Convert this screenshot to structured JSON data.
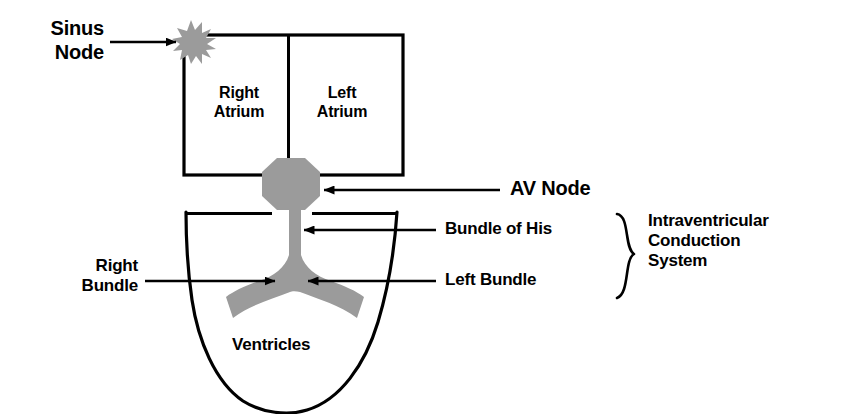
{
  "diagram": {
    "colors": {
      "tissue_gray": "#9b9b9b",
      "outline_black": "#000000",
      "background": "#ffffff"
    },
    "chambers": [
      {
        "id": "right-atrium",
        "label": "Right\nAtrium"
      },
      {
        "id": "left-atrium",
        "label": "Left\nAtrium"
      },
      {
        "id": "ventricles",
        "label": "Ventricles"
      }
    ],
    "labels": {
      "sinus_node": "Sinus\nNode",
      "av_node": "AV Node",
      "bundle_of_his": "Bundle of His",
      "left_bundle": "Left Bundle",
      "right_bundle": "Right\nBundle",
      "right_atrium": "Right\nAtrium",
      "left_atrium": "Left\nAtrium",
      "ventricles": "Ventricles",
      "group_bracket": "Intraventricular\nConduction\nSystem"
    },
    "structures": [
      {
        "name": "sinus-node",
        "shape": "starburst",
        "fill": "#9b9b9b"
      },
      {
        "name": "av-node",
        "shape": "octagon",
        "fill": "#9b9b9b"
      },
      {
        "name": "bundle-of-his",
        "shape": "stem",
        "fill": "#9b9b9b"
      },
      {
        "name": "left-bundle-branch",
        "shape": "curve",
        "fill": "#9b9b9b"
      },
      {
        "name": "right-bundle-branch",
        "shape": "curve",
        "fill": "#9b9b9b"
      }
    ],
    "annotations": [
      {
        "name": "sinus-node-pointer",
        "direction": "right",
        "target": "sinus-node"
      },
      {
        "name": "av-node-pointer",
        "direction": "left",
        "target": "av-node"
      },
      {
        "name": "bundle-of-his-pointer",
        "direction": "left",
        "target": "bundle-of-his"
      },
      {
        "name": "left-bundle-pointer",
        "direction": "left",
        "target": "left-bundle-branch"
      },
      {
        "name": "right-bundle-pointer",
        "direction": "right",
        "target": "right-bundle-branch"
      }
    ]
  }
}
